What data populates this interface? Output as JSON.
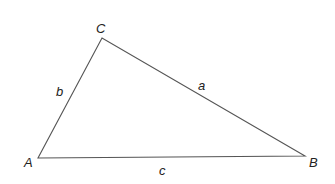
{
  "diagram": {
    "type": "triangle",
    "vertices": [
      {
        "id": "A",
        "label": "A",
        "x": 38,
        "y": 158
      },
      {
        "id": "B",
        "label": "B",
        "x": 305,
        "y": 156
      },
      {
        "id": "C",
        "label": "C",
        "x": 102,
        "y": 38
      }
    ],
    "sides": [
      {
        "id": "a",
        "label": "a",
        "from": "B",
        "to": "C"
      },
      {
        "id": "b",
        "label": "b",
        "from": "A",
        "to": "C"
      },
      {
        "id": "c",
        "label": "c",
        "from": "A",
        "to": "B"
      }
    ],
    "stroke_color": "#555555",
    "label_color": "#222222"
  }
}
